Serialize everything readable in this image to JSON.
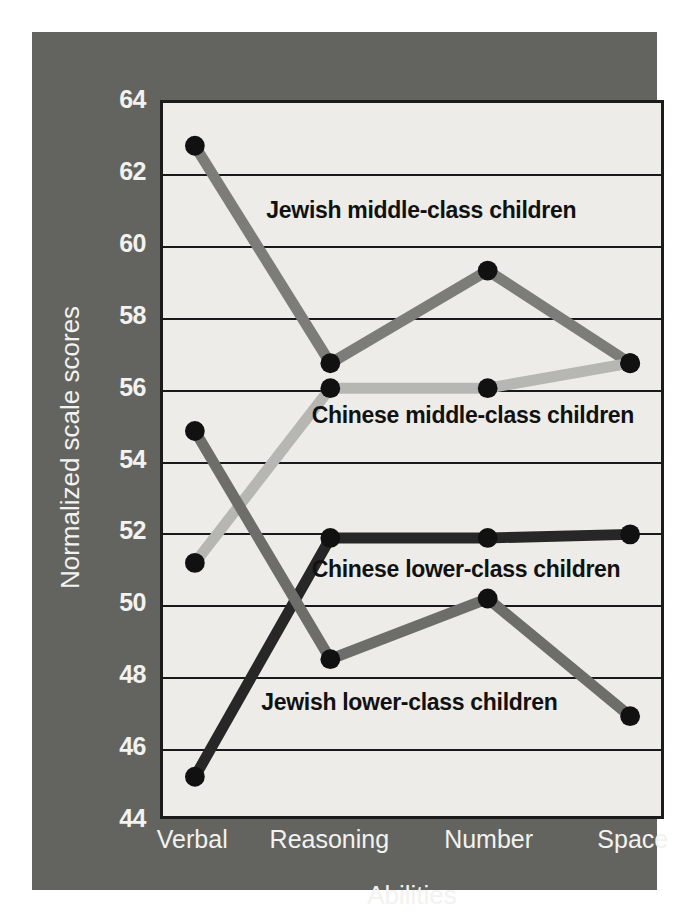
{
  "chart_data": {
    "type": "line",
    "title": "",
    "xlabel": "Abilities",
    "ylabel": "Normalized scale scores",
    "categories": [
      "Verbal",
      "Reasoning",
      "Number",
      "Space"
    ],
    "ylim": [
      44,
      64
    ],
    "yticks": [
      44,
      46,
      48,
      50,
      52,
      54,
      56,
      58,
      60,
      62,
      64
    ],
    "grid": true,
    "legend_position": "inline-annotations",
    "series": [
      {
        "name": "Jewish middle-class children",
        "color": "#7c7c78",
        "values": [
          62.8,
          56.7,
          59.3,
          56.7
        ]
      },
      {
        "name": "Chinese middle-class children",
        "color": "#b6b6b2",
        "values": [
          51.1,
          56.0,
          56.0,
          56.7
        ]
      },
      {
        "name": "Chinese lower-class children",
        "color": "#272727",
        "values": [
          45.1,
          51.8,
          51.8,
          51.9
        ]
      },
      {
        "name": "Jewish lower-class children",
        "color": "#6d6d6a",
        "values": [
          54.8,
          48.4,
          50.1,
          46.8
        ]
      }
    ],
    "annotations": [
      {
        "text": "Jewish middle-class children",
        "value": 61.0
      },
      {
        "text": "Chinese middle-class children",
        "value": 55.3
      },
      {
        "text": "Chinese lower-class children",
        "value": 51.0
      },
      {
        "text": "Jewish lower-class children",
        "value": 47.3
      }
    ]
  },
  "colors": {
    "panel_background": "#63645f",
    "plot_background": "#edece8",
    "axis_text": "#f2f2f0",
    "gridline": "#191919",
    "marker": "#111111"
  }
}
